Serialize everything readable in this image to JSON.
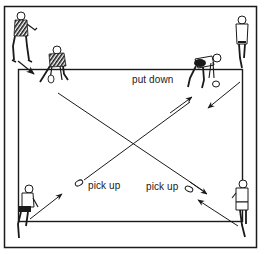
{
  "diagram": {
    "type": "drill-illustration",
    "labels": {
      "put_down": "put down",
      "pick_up_left": "pick up",
      "pick_up_right": "pick up"
    },
    "players": [
      {
        "id": "top-left-standing",
        "pose": "standing ready"
      },
      {
        "id": "top-left-crouching",
        "pose": "crouching at corner"
      },
      {
        "id": "top-right-bending",
        "pose": "bending to put down object"
      },
      {
        "id": "top-right-standing",
        "pose": "standing at corner"
      },
      {
        "id": "bottom-left-runner",
        "pose": "running"
      },
      {
        "id": "bottom-right-runner",
        "pose": "running"
      }
    ],
    "paths": [
      {
        "from": "bottom-left corner",
        "to": "top-right corner",
        "via": "pick up object"
      },
      {
        "from": "top-left corner",
        "to": "bottom-right corner",
        "via": "pick up object"
      },
      {
        "from": "top-right corner",
        "to": "bottom-left",
        "direction": "down-left"
      },
      {
        "from": "bottom-right corner",
        "to": "pick up object",
        "direction": "up-left"
      }
    ],
    "colors": {
      "ink": "#1a1a1a",
      "background": "#ffffff"
    }
  }
}
